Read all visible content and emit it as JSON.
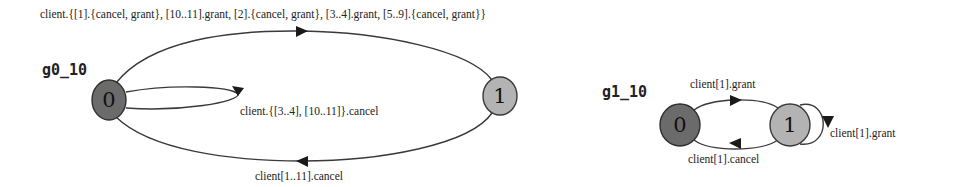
{
  "graphs": [
    {
      "id": "g0_10",
      "title": "g0_10",
      "nodes": [
        {
          "label": "0",
          "role": "initial",
          "fill": "#6b6b6b"
        },
        {
          "label": "1",
          "fill": "#b3b3b3"
        }
      ],
      "edges": [
        {
          "from": "0",
          "to": "1",
          "label": "client.{[1].{cancel, grant}, [10..11].grant, [2].{cancel, grant}, [3..4].grant, [5..9].{cancel, grant}}"
        },
        {
          "from": "0",
          "to": "0",
          "label": "client.{[3..4], [10..11]}.cancel"
        },
        {
          "from": "1",
          "to": "0",
          "label": "client[1..11].cancel"
        }
      ]
    },
    {
      "id": "g1_10",
      "title": "g1_10",
      "nodes": [
        {
          "label": "0",
          "role": "initial",
          "fill": "#6b6b6b"
        },
        {
          "label": "1",
          "fill": "#b3b3b3"
        }
      ],
      "edges": [
        {
          "from": "0",
          "to": "1",
          "label": "client[1].grant"
        },
        {
          "from": "1",
          "to": "1",
          "label": "client[1].grant"
        },
        {
          "from": "1",
          "to": "0",
          "label": "client[1].cancel"
        }
      ]
    }
  ]
}
